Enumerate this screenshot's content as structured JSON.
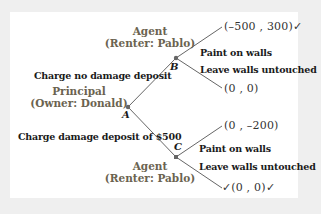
{
  "diagram": {
    "type": "game-tree",
    "colors": {
      "background": "#efefef",
      "panel": "#ffffff",
      "role_text": "#6b6350",
      "line": "#555555"
    },
    "nodes": {
      "A": {
        "label": "A",
        "role": "Principal",
        "player": "(Owner: Donald)"
      },
      "B": {
        "label": "B",
        "role": "Agent",
        "player": "(Renter: Pablo)"
      },
      "C": {
        "label": "C",
        "role": "Agent",
        "player": "(Renter: Pablo)"
      }
    },
    "edges": {
      "a_to_b": "Charge no damage deposit",
      "a_to_c": "Charge damage deposit of $500",
      "b_paint": "Paint on walls",
      "b_leave": "Leave walls untouched",
      "c_paint": "Paint on walls",
      "c_leave": "Leave walls untouched"
    },
    "payoffs": {
      "b_paint": "(–500 , 300)✓",
      "b_leave": "(0 , 0)",
      "c_paint": "(0 , –200)",
      "c_leave": "✓(0 , 0)✓"
    }
  }
}
